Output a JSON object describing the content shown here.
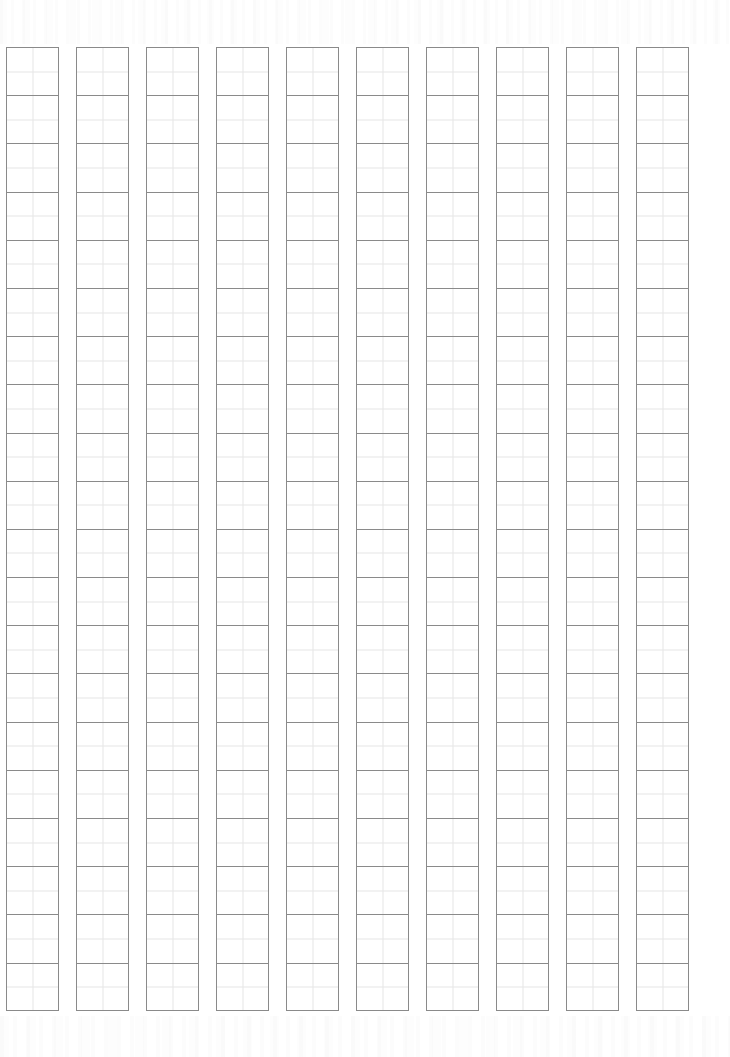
{
  "sheet": {
    "kind": "writing-practice-grid",
    "title": "",
    "page_width": 730,
    "page_height": 1057,
    "background_color": "#ffffff",
    "orientation": "portrait"
  },
  "grid": {
    "columns": 10,
    "rows_per_column": 20,
    "total_cells": 200,
    "origin_x": 6,
    "origin_y": 47,
    "cell_width": 53,
    "cell_height": 48.2,
    "column_pitch": 70,
    "column_gap": 17,
    "border_color": "#8a8a8a",
    "border_width": 1,
    "guide_line_color": "#e6e6e6",
    "guide_line_width": 1,
    "guide_lines": [
      "vertical-center",
      "horizontal-center"
    ],
    "cell_fill": "transparent",
    "reading_direction": "top-to-bottom, right-to-left",
    "column_labels": [
      "1",
      "2",
      "3",
      "4",
      "5",
      "6",
      "7",
      "8",
      "9",
      "10"
    ],
    "cell_contents": [
      [
        "",
        "",
        "",
        "",
        "",
        "",
        "",
        "",
        "",
        "",
        "",
        "",
        "",
        "",
        "",
        "",
        "",
        "",
        "",
        ""
      ],
      [
        "",
        "",
        "",
        "",
        "",
        "",
        "",
        "",
        "",
        "",
        "",
        "",
        "",
        "",
        "",
        "",
        "",
        "",
        "",
        ""
      ],
      [
        "",
        "",
        "",
        "",
        "",
        "",
        "",
        "",
        "",
        "",
        "",
        "",
        "",
        "",
        "",
        "",
        "",
        "",
        "",
        ""
      ],
      [
        "",
        "",
        "",
        "",
        "",
        "",
        "",
        "",
        "",
        "",
        "",
        "",
        "",
        "",
        "",
        "",
        "",
        "",
        "",
        ""
      ],
      [
        "",
        "",
        "",
        "",
        "",
        "",
        "",
        "",
        "",
        "",
        "",
        "",
        "",
        "",
        "",
        "",
        "",
        "",
        "",
        ""
      ],
      [
        "",
        "",
        "",
        "",
        "",
        "",
        "",
        "",
        "",
        "",
        "",
        "",
        "",
        "",
        "",
        "",
        "",
        "",
        "",
        ""
      ],
      [
        "",
        "",
        "",
        "",
        "",
        "",
        "",
        "",
        "",
        "",
        "",
        "",
        "",
        "",
        "",
        "",
        "",
        "",
        "",
        ""
      ],
      [
        "",
        "",
        "",
        "",
        "",
        "",
        "",
        "",
        "",
        "",
        "",
        "",
        "",
        "",
        "",
        "",
        "",
        "",
        "",
        ""
      ],
      [
        "",
        "",
        "",
        "",
        "",
        "",
        "",
        "",
        "",
        "",
        "",
        "",
        "",
        "",
        "",
        "",
        "",
        "",
        "",
        ""
      ],
      [
        "",
        "",
        "",
        "",
        "",
        "",
        "",
        "",
        "",
        "",
        "",
        "",
        "",
        "",
        "",
        "",
        "",
        "",
        "",
        ""
      ]
    ]
  },
  "margins": {
    "top_margin_height": 44,
    "bottom_margin_height": 41,
    "left_margin_width": 6,
    "right_margin_width": 42,
    "scan_artifact_note": ""
  }
}
